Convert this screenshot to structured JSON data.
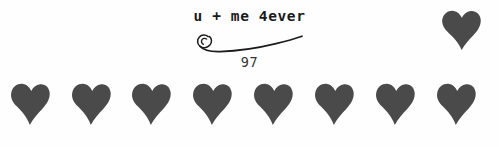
{
  "image": {
    "width": 499,
    "height": 147,
    "background_color": "#fefefe"
  },
  "caption": {
    "text": "u + me 4ever",
    "number": "97",
    "text_color": "#1a1a1a",
    "number_color": "#33332f",
    "flourish_name": "spiral-swirl-flourish",
    "flourish_color": "#1c1c1c"
  },
  "hearts": {
    "color": "#4a4a4a",
    "accent": {
      "name": "heart-accent-top-right",
      "x": 441,
      "y": 9,
      "width": 40,
      "height": 42
    },
    "row": {
      "name": "heart-row",
      "count": 8,
      "y": 82,
      "width": 40,
      "height": 44,
      "x_positions": [
        10,
        71,
        131,
        192,
        253,
        314,
        375,
        436
      ]
    }
  }
}
